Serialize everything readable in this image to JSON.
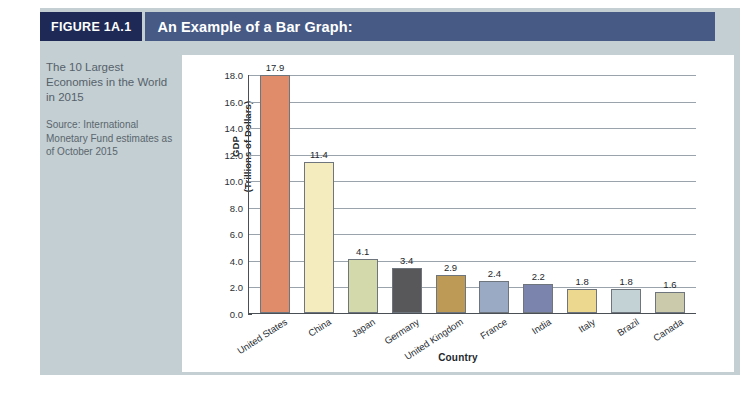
{
  "figure": {
    "number_label": "FIGURE 1A.1",
    "title": "An Example of a Bar Graph:",
    "caption_title": "The 10 Largest Economies in the World in 2015",
    "caption_source": "Source: International Monetary Fund estimates as of October 2015"
  },
  "colors": {
    "panel_background": "#c3cfd2",
    "badge_background": "#1e2a55",
    "title_background": "#465a85",
    "chart_background": "#ffffff",
    "axis_line": "#4a4f55",
    "gridline": "#9aa3ab"
  },
  "chart_data": {
    "type": "bar",
    "title": "An Example of a Bar Graph:",
    "subtitle": "The 10 Largest Economies in the World in 2015",
    "xlabel": "Country",
    "ylabel": "GDP (Trillions of Dollars)",
    "ylabel_line1": "GDP",
    "ylabel_line2": "(Trillions of Dollars)",
    "ylim": [
      0,
      18
    ],
    "ytick_step": 2,
    "yticks": [
      "18.0",
      "16.0",
      "14.0",
      "12.0",
      "10.0",
      "8.0",
      "6.0",
      "4.0",
      "2.0",
      "0.0"
    ],
    "grid": true,
    "legend": false,
    "categories": [
      "United States",
      "China",
      "Japan",
      "Germany",
      "United Kingdom",
      "France",
      "India",
      "Italy",
      "Brazil",
      "Canada"
    ],
    "values": [
      17.9,
      11.4,
      4.1,
      3.4,
      2.9,
      2.4,
      2.2,
      1.8,
      1.8,
      1.6
    ],
    "value_labels": [
      "17.9",
      "11.4",
      "4.1",
      "3.4",
      "2.9",
      "2.4",
      "2.2",
      "1.8",
      "1.8",
      "1.6"
    ],
    "bar_colors": [
      "#e08b6a",
      "#f4ecbf",
      "#d3d9ab",
      "#58585a",
      "#bd9a56",
      "#9aa9c4",
      "#7b84ad",
      "#ecd88e",
      "#c3d2d4",
      "#cbcbab"
    ]
  }
}
